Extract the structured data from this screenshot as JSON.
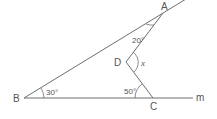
{
  "diagram": {
    "points": {
      "A": {
        "label": "A",
        "x": 163,
        "y": 13
      },
      "B": {
        "label": "B",
        "x": 24,
        "y": 98
      },
      "C": {
        "label": "C",
        "x": 153,
        "y": 98
      },
      "D": {
        "label": "D",
        "x": 126,
        "y": 62
      }
    },
    "line_label": "m",
    "angles": {
      "B": "30°",
      "A": "20°",
      "C": "50°",
      "D": "x"
    },
    "colors": {
      "stroke": "#6e6e6e",
      "text": "#555555",
      "background": "#ffffff"
    }
  }
}
